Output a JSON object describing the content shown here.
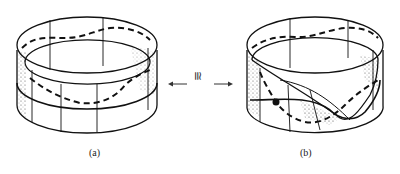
{
  "figure": {
    "panels": [
      {
        "id": "a",
        "label": "(a)",
        "description": "Cylindrical band with dashed curve and horizontal ring line"
      },
      {
        "id": "b",
        "label": "(b)",
        "description": "Twisted band (Möbius-like) inside cylinder with dashed curve and marked point"
      }
    ],
    "relation_symbol": "≅",
    "arrows": {
      "left": "←",
      "right": "→"
    }
  }
}
